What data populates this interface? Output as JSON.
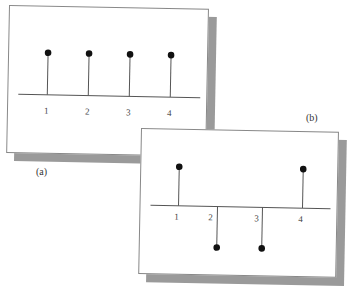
{
  "figure": {
    "panels": [
      {
        "id": "a",
        "caption": "(a)",
        "axis_labels": [
          "1",
          "2",
          "3",
          "4"
        ],
        "stems": [
          {
            "x": "1",
            "value": 1
          },
          {
            "x": "2",
            "value": 1
          },
          {
            "x": "3",
            "value": 1
          },
          {
            "x": "4",
            "value": 1
          }
        ]
      },
      {
        "id": "b",
        "caption": "(b)",
        "axis_labels": [
          "1",
          "2",
          "3",
          "4"
        ],
        "stems": [
          {
            "x": "1",
            "value": 1
          },
          {
            "x": "2",
            "value": -1
          },
          {
            "x": "3",
            "value": -1
          },
          {
            "x": "4",
            "value": 1
          }
        ]
      }
    ],
    "colors": {
      "panel_bg": "#ffffff",
      "panel_border": "#888888",
      "shadow": "#9a9a9a",
      "stem": "#555555",
      "dot": "#111111"
    }
  }
}
